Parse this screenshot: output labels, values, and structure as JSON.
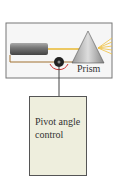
{
  "labels": {
    "prism": "Prism",
    "control": "Pivot angle control"
  },
  "colors": {
    "beam": "#e8b830",
    "frame": "#666666",
    "control_bg": "#eeeedd",
    "pivot_arrow": "#cc3333"
  }
}
